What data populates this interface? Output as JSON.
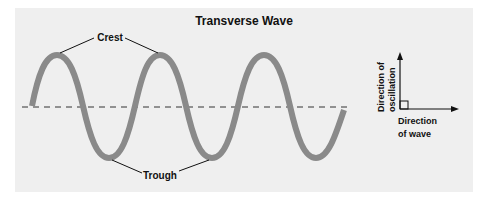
{
  "title": "Transverse Wave",
  "labels": {
    "crest": "Crest",
    "trough": "Trough",
    "oscillation_line1": "Direction of",
    "oscillation_line2": "oscillation",
    "wave_line1": "Direction",
    "wave_line2": "of wave"
  },
  "colors": {
    "panel": "#efefef",
    "wave": "#8a8a8a",
    "ink": "#111111"
  }
}
